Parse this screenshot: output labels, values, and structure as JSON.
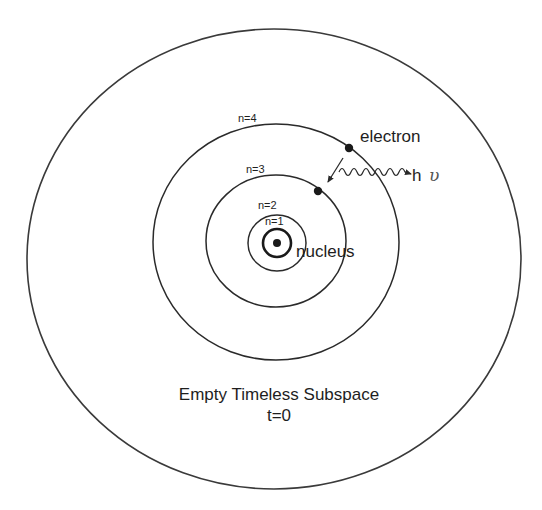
{
  "diagram": {
    "labels": {
      "n1": "n=1",
      "n2": "n=2",
      "n3": "n=3",
      "n4": "n=4",
      "nucleus": "nucleus",
      "electron": "electron",
      "photon_h": "h",
      "photon_nu": "υ",
      "caption_line1": "Empty Timeless Subspace",
      "caption_line2": "t=0"
    },
    "orbits": [
      {
        "name": "n=1",
        "rx": 15,
        "ry": 15
      },
      {
        "name": "n=2",
        "rx": 29,
        "ry": 28
      },
      {
        "name": "n=3",
        "rx": 70,
        "ry": 66
      },
      {
        "name": "n=4",
        "rx": 123,
        "ry": 118
      }
    ],
    "outer_boundary": {
      "rx": 247,
      "ry": 230
    },
    "colors": {
      "stroke": "#2a2a2a",
      "text": "#1e1e1e",
      "background": "#ffffff"
    }
  }
}
